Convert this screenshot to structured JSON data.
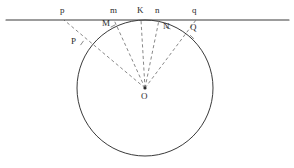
{
  "figure": {
    "width": 294,
    "height": 168,
    "background_color": "#ffffff",
    "stroke_color": "#3a3a3a",
    "dashed_stroke_color": "#6a6a6a",
    "label_color": "#2b2b2b"
  },
  "tangent_line": {
    "name": "horizontal tangent line",
    "y": 20,
    "x_start": 6,
    "x_end": 289,
    "stroke_width": 1.1
  },
  "circle": {
    "name": "circle O",
    "center_x": 145,
    "center_y": 88,
    "radius": 68,
    "stroke_width": 1.0
  },
  "center_point": {
    "label": "O",
    "x": 145,
    "y": 88,
    "label_x": 141,
    "label_y": 92,
    "dot_radius": 1.6
  },
  "line_points": [
    {
      "label": "p",
      "x": 64,
      "y": 20,
      "label_x": 60,
      "label_y": 6
    },
    {
      "label": "m",
      "x": 114,
      "y": 20,
      "label_x": 110,
      "label_y": 6
    },
    {
      "label": "K",
      "x": 141,
      "y": 20,
      "label_x": 137,
      "label_y": 6
    },
    {
      "label": "n",
      "x": 159,
      "y": 20,
      "label_x": 155,
      "label_y": 6
    },
    {
      "label": "q",
      "x": 196,
      "y": 20,
      "label_x": 192,
      "label_y": 6
    }
  ],
  "circle_points": [
    {
      "label": "P",
      "x": 82,
      "y": 43,
      "label_x": 71,
      "label_y": 37
    },
    {
      "label": "M",
      "x": 113,
      "y": 26,
      "label_x": 102,
      "label_y": 19
    },
    {
      "label": "N",
      "x": 168,
      "y": 28,
      "label_x": 163,
      "label_y": 22
    },
    {
      "label": "Q",
      "x": 192,
      "y": 37,
      "label_x": 190,
      "label_y": 23
    }
  ],
  "rays": [
    {
      "name": "ray-O-P-p",
      "x1": 145,
      "y1": 88,
      "x2": 64,
      "y2": 20
    },
    {
      "name": "ray-O-M-m",
      "x1": 145,
      "y1": 88,
      "x2": 114,
      "y2": 20
    },
    {
      "name": "ray-O-K",
      "x1": 145,
      "y1": 88,
      "x2": 141,
      "y2": 20
    },
    {
      "name": "ray-O-N-n",
      "x1": 145,
      "y1": 88,
      "x2": 159,
      "y2": 20
    },
    {
      "name": "ray-O-Q-q",
      "x1": 145,
      "y1": 88,
      "x2": 196,
      "y2": 20
    }
  ],
  "dash_pattern": "3.2 2.6"
}
